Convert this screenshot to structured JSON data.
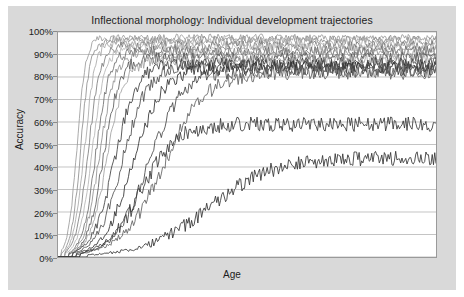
{
  "figure": {
    "title": "Inflectional morphology: Individual development trajectories",
    "xlabel": "Age",
    "ylabel": "Accuracy"
  },
  "yticks": [
    {
      "label": "100%",
      "value": 100
    },
    {
      "label": "90%",
      "value": 90
    },
    {
      "label": "80%",
      "value": 80
    },
    {
      "label": "70%",
      "value": 70
    },
    {
      "label": "60%",
      "value": 60
    },
    {
      "label": "50%",
      "value": 50
    },
    {
      "label": "40%",
      "value": 40
    },
    {
      "label": "30%",
      "value": 30
    },
    {
      "label": "20%",
      "value": 20
    },
    {
      "label": "10%",
      "value": 10
    },
    {
      "label": "0%",
      "value": 0
    }
  ],
  "colors": {
    "panel_background": "#d9d9d9",
    "plot_background": "#ffffff",
    "grid": "#b5b5b5",
    "frame": "#9a9a9a",
    "text": "#1c1c1c"
  },
  "chart_data": {
    "type": "line",
    "title": "Inflectional morphology: Individual development trajectories",
    "xlabel": "Age",
    "ylabel": "Accuracy",
    "xlim": [
      0,
      100
    ],
    "ylim": [
      0,
      100
    ],
    "grid": true,
    "grid_axis": "y",
    "legend": "none",
    "xtick_labels": [],
    "ytick_labels": [
      "0%",
      "10%",
      "20%",
      "30%",
      "40%",
      "50%",
      "60%",
      "70%",
      "80%",
      "90%",
      "100%"
    ],
    "series": [
      {
        "name": "child-01",
        "color": "#9a9a9a",
        "asymptote": 97.5,
        "midpoint": 5,
        "rate": 0.85,
        "noise": 1.6,
        "onset": 1
      },
      {
        "name": "child-02",
        "color": "#8e8e8e",
        "asymptote": 96.5,
        "midpoint": 6,
        "rate": 0.8,
        "noise": 1.8,
        "onset": 1
      },
      {
        "name": "child-03",
        "color": "#a8a8a8",
        "asymptote": 95.5,
        "midpoint": 7,
        "rate": 0.7,
        "noise": 2.0,
        "onset": 2
      },
      {
        "name": "child-04",
        "color": "#7c7c7c",
        "asymptote": 94.0,
        "midpoint": 8,
        "rate": 0.62,
        "noise": 2.2,
        "onset": 2
      },
      {
        "name": "child-05",
        "color": "#b4b4b4",
        "asymptote": 93.0,
        "midpoint": 9,
        "rate": 0.58,
        "noise": 2.1,
        "onset": 2
      },
      {
        "name": "child-06",
        "color": "#6e6e6e",
        "asymptote": 91.5,
        "midpoint": 10,
        "rate": 0.55,
        "noise": 2.3,
        "onset": 3
      },
      {
        "name": "child-07",
        "color": "#909090",
        "asymptote": 90.5,
        "midpoint": 11,
        "rate": 0.5,
        "noise": 2.4,
        "onset": 3
      },
      {
        "name": "child-08",
        "color": "#5a5a5a",
        "asymptote": 88.5,
        "midpoint": 12,
        "rate": 0.46,
        "noise": 2.6,
        "onset": 3
      },
      {
        "name": "child-09",
        "color": "#a0a0a0",
        "asymptote": 87.5,
        "midpoint": 13,
        "rate": 0.42,
        "noise": 2.5,
        "onset": 4
      },
      {
        "name": "child-10",
        "color": "#3f3f3f",
        "asymptote": 86.0,
        "midpoint": 15,
        "rate": 0.34,
        "noise": 2.8,
        "onset": 4
      },
      {
        "name": "child-11",
        "color": "#505050",
        "asymptote": 85.0,
        "midpoint": 17,
        "rate": 0.3,
        "noise": 2.9,
        "onset": 4
      },
      {
        "name": "child-12",
        "color": "#2e2e2e",
        "asymptote": 84.0,
        "midpoint": 20,
        "rate": 0.26,
        "noise": 3.0,
        "onset": 5
      },
      {
        "name": "child-13",
        "color": "#454545",
        "asymptote": 83.0,
        "midpoint": 24,
        "rate": 0.22,
        "noise": 3.1,
        "onset": 5
      },
      {
        "name": "child-14",
        "color": "#606060",
        "asymptote": 82.0,
        "midpoint": 28,
        "rate": 0.18,
        "noise": 3.2,
        "onset": 6
      },
      {
        "name": "child-15",
        "color": "#383838",
        "asymptote": 59.0,
        "midpoint": 22,
        "rate": 0.22,
        "noise": 3.4,
        "onset": 6
      },
      {
        "name": "child-16",
        "color": "#333333",
        "asymptote": 44.0,
        "midpoint": 40,
        "rate": 0.12,
        "noise": 3.2,
        "onset": 8
      }
    ]
  }
}
